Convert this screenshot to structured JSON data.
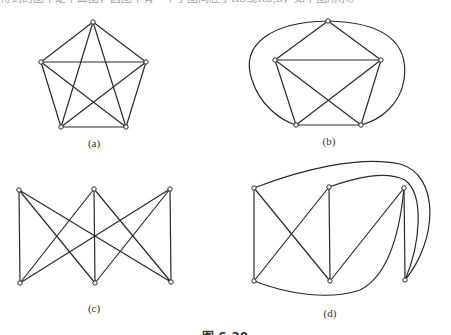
{
  "header_text": "得到的图不是平面图，因图中有一个子图同胚于K5或K3,3，如下图所示。",
  "figures": [
    {
      "id": "a",
      "label": "(a)",
      "label_pos": [
        94,
        137
      ],
      "vertices": [
        [
          93,
          22
        ],
        [
          41,
          62
        ],
        [
          146,
          62
        ],
        [
          61,
          127
        ],
        [
          126,
          127
        ]
      ],
      "edges": [
        [
          0,
          1
        ],
        [
          0,
          2
        ],
        [
          0,
          3
        ],
        [
          0,
          4
        ],
        [
          1,
          2
        ],
        [
          1,
          3
        ],
        [
          1,
          4
        ],
        [
          2,
          3
        ],
        [
          2,
          4
        ],
        [
          3,
          4
        ]
      ],
      "curves": []
    },
    {
      "id": "b",
      "label": "(b)",
      "label_pos": [
        329,
        135
      ],
      "vertices": [
        [
          328,
          21
        ],
        [
          275,
          60
        ],
        [
          381,
          60
        ],
        [
          296,
          125
        ],
        [
          361,
          125
        ]
      ],
      "edges": [
        [
          0,
          1
        ],
        [
          0,
          2
        ],
        [
          1,
          2
        ],
        [
          1,
          3
        ],
        [
          1,
          4
        ],
        [
          2,
          3
        ],
        [
          2,
          4
        ],
        [
          3,
          4
        ]
      ],
      "curves": [
        "M328,21 C270,22 240,45 252,80 C260,105 280,120 296,125",
        "M328,21 C380,22 410,40 404,80 C400,105 380,120 361,125"
      ]
    },
    {
      "id": "c",
      "label": "(c)",
      "label_pos": [
        94,
        302
      ],
      "vertices": [
        [
          19,
          190
        ],
        [
          94,
          189
        ],
        [
          170,
          189
        ],
        [
          20,
          283
        ],
        [
          95,
          283
        ],
        [
          171,
          282
        ]
      ],
      "edges": [
        [
          0,
          3
        ],
        [
          0,
          4
        ],
        [
          0,
          5
        ],
        [
          1,
          3
        ],
        [
          1,
          4
        ],
        [
          1,
          5
        ],
        [
          2,
          3
        ],
        [
          2,
          4
        ],
        [
          2,
          5
        ]
      ],
      "curves": []
    },
    {
      "id": "d",
      "label": "(d)",
      "label_pos": [
        330,
        307
      ],
      "vertices": [
        [
          254,
          188
        ],
        [
          329,
          187
        ],
        [
          404,
          188
        ],
        [
          254,
          281
        ],
        [
          330,
          281
        ],
        [
          405,
          280
        ]
      ],
      "edges": [
        [
          0,
          3
        ],
        [
          0,
          4
        ],
        [
          1,
          3
        ],
        [
          1,
          4
        ],
        [
          2,
          4
        ],
        [
          2,
          5
        ]
      ],
      "curves": [
        "M254,281 C290,295 330,300 360,290 C390,275 400,230 404,188",
        "M254,188 C300,170 360,155 400,164 C440,175 438,240 405,280",
        "M329,187 C355,178 385,170 405,180 C425,195 420,245 405,280"
      ]
    }
  ],
  "caption": "图 6-30",
  "colors": {
    "stroke": "#2a2a2a",
    "background": "#ffffff"
  }
}
